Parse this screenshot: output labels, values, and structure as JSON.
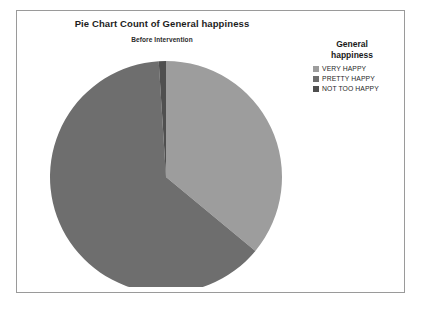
{
  "chart_data": {
    "type": "pie",
    "title": "Pie Chart Count of General happiness",
    "subtitle": "Before Intervention",
    "legend_title_line1": "General",
    "legend_title_line2": "happiness",
    "legend_position": "right",
    "categories": [
      "VERY HAPPY",
      "PRETTY HAPPY",
      "NOT TOO HAPPY"
    ],
    "values": [
      36,
      63,
      1
    ],
    "colors": [
      "#9d9d9d",
      "#6e6e6e",
      "#4f4f4f"
    ],
    "slices": [
      {
        "label": "VERY HAPPY",
        "value": 36,
        "color": "#9d9d9d",
        "start_angle": 0,
        "end_angle": 129.6
      },
      {
        "label": "PRETTY HAPPY",
        "value": 63,
        "color": "#6e6e6e",
        "start_angle": 129.6,
        "end_angle": 356.4
      },
      {
        "label": "NOT TOO HAPPY",
        "value": 1,
        "color": "#4f4f4f",
        "start_angle": 356.4,
        "end_angle": 360
      }
    ],
    "xlabel": "",
    "ylabel": "",
    "grid": false
  },
  "frame": {
    "border_color": "#9a9a9a",
    "background": "#ffffff"
  }
}
